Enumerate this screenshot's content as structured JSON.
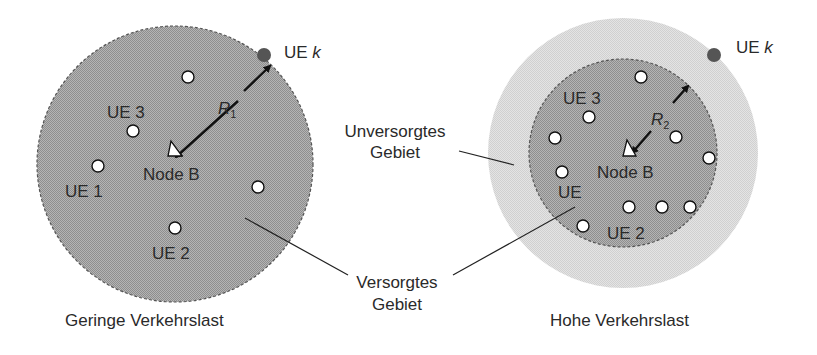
{
  "left_panel": {
    "caption": "Geringe Verkehrslast",
    "node_label": "Node B",
    "radius_label": "R",
    "radius_sub": "1",
    "ue_k_label": "UE ",
    "ue_k_italic": "k",
    "ue_labels": [
      "UE 3",
      "UE 1",
      "UE 2"
    ]
  },
  "right_panel": {
    "caption": "Hohe Verkehrslast",
    "node_label": "Node B",
    "radius_label": "R",
    "radius_sub": "2",
    "ue_k_label": "UE ",
    "ue_k_italic": "k",
    "ue_labels": [
      "UE 3",
      "UE",
      "UE 2"
    ]
  },
  "callouts": {
    "unserved_line1": "Unversorgtes",
    "unserved_line2": "Gebiet",
    "served_line1": "Versorgtes",
    "served_line2": "Gebiet"
  },
  "colors": {
    "served_area": "#a8a8a8",
    "unserved_area": "#dcdcdc",
    "ue_k_dot": "#555555",
    "text": "#2a2a2a"
  }
}
